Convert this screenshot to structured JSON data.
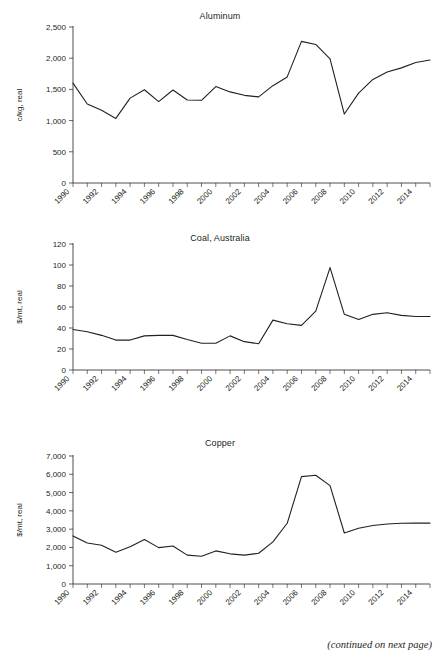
{
  "page": {
    "cut_off_heading": "",
    "footer_note": "(continued on next page)",
    "background_color": "#ffffff",
    "line_color": "#231f20"
  },
  "charts": [
    {
      "id": "aluminum",
      "title": "Aluminum",
      "ylabel": "c/kg, real",
      "xlabel": "",
      "yticks": [
        "0",
        "500",
        "1,000",
        "1,500",
        "2,000",
        "2,500"
      ],
      "xticks": [
        "1990",
        "1992",
        "1994",
        "1996",
        "1998",
        "2000",
        "2002",
        "2004",
        "2006",
        "2008",
        "2010",
        "2012",
        "2014"
      ]
    },
    {
      "id": "coal-australia",
      "title": "Coal, Australia",
      "ylabel": "$/mt, real",
      "xlabel": "",
      "yticks": [
        "0",
        "20",
        "40",
        "60",
        "80",
        "100",
        "120"
      ],
      "xticks": [
        "1990",
        "1992",
        "1994",
        "1996",
        "1998",
        "2000",
        "2002",
        "2004",
        "2006",
        "2008",
        "2010",
        "2012",
        "2014"
      ]
    },
    {
      "id": "copper",
      "title": "Copper",
      "ylabel": "$/mt, real",
      "xlabel": "",
      "yticks": [
        "0",
        "1,000",
        "2,000",
        "3,000",
        "4,000",
        "5,000",
        "6,000",
        "7,000"
      ],
      "xticks": [
        "1990",
        "1992",
        "1994",
        "1996",
        "1998",
        "2000",
        "2002",
        "2004",
        "2006",
        "2008",
        "2010",
        "2012",
        "2014"
      ]
    }
  ],
  "chart_data": [
    {
      "type": "line",
      "title": "Aluminum",
      "xlabel": "",
      "ylabel": "c/kg, real",
      "ylim": [
        0,
        2500
      ],
      "ytick_values": [
        0,
        500,
        1000,
        1500,
        2000,
        2500
      ],
      "xlim": [
        1990,
        2015
      ],
      "xtick_values": [
        1990,
        1992,
        1994,
        1996,
        1998,
        2000,
        2002,
        2004,
        2006,
        2008,
        2010,
        2012,
        2014
      ],
      "grid": false,
      "legend": false,
      "x": [
        1990,
        1991,
        1992,
        1993,
        1994,
        1995,
        1996,
        1997,
        1998,
        1999,
        2000,
        2001,
        2002,
        2003,
        2004,
        2005,
        2006,
        2007,
        2008,
        2009,
        2010,
        2011,
        2012,
        2013,
        2014,
        2015
      ],
      "series": [
        {
          "name": "Aluminum",
          "values": [
            1600,
            1265,
            1165,
            1035,
            1360,
            1495,
            1305,
            1490,
            1330,
            1325,
            1545,
            1460,
            1405,
            1380,
            1560,
            1700,
            2270,
            2220,
            1990,
            1105,
            1440,
            1660,
            1780,
            1845,
            1930,
            1970
          ]
        }
      ]
    },
    {
      "type": "line",
      "title": "Coal, Australia",
      "xlabel": "",
      "ylabel": "$/mt, real",
      "ylim": [
        0,
        120
      ],
      "ytick_values": [
        0,
        20,
        40,
        60,
        80,
        100,
        120
      ],
      "xlim": [
        1990,
        2015
      ],
      "xtick_values": [
        1990,
        1992,
        1994,
        1996,
        1998,
        2000,
        2002,
        2004,
        2006,
        2008,
        2010,
        2012,
        2014
      ],
      "grid": false,
      "legend": false,
      "x": [
        1990,
        1991,
        1992,
        1993,
        1994,
        1995,
        1996,
        1997,
        1998,
        1999,
        2000,
        2001,
        2002,
        2003,
        2004,
        2005,
        2006,
        2007,
        2008,
        2009,
        2010,
        2011,
        2012,
        2013,
        2014,
        2015
      ],
      "series": [
        {
          "name": "Coal, Australia",
          "values": [
            38.5,
            36.5,
            33,
            28.5,
            28.5,
            32.5,
            33,
            33,
            29,
            25.5,
            25.5,
            32.5,
            27,
            25,
            47.5,
            44,
            42.5,
            56,
            97.5,
            53,
            48,
            53,
            54.5,
            52,
            51,
            51
          ]
        }
      ]
    },
    {
      "type": "line",
      "title": "Copper",
      "xlabel": "",
      "ylabel": "$/mt, real",
      "ylim": [
        0,
        7000
      ],
      "ytick_values": [
        0,
        1000,
        2000,
        3000,
        4000,
        5000,
        6000,
        7000
      ],
      "xlim": [
        1990,
        2015
      ],
      "xtick_values": [
        1990,
        1992,
        1994,
        1996,
        1998,
        2000,
        2002,
        2004,
        2006,
        2008,
        2010,
        2012,
        2014
      ],
      "grid": false,
      "legend": false,
      "x": [
        1990,
        1991,
        1992,
        1993,
        1994,
        1995,
        1996,
        1997,
        1998,
        1999,
        2000,
        2001,
        2002,
        2003,
        2004,
        2005,
        2006,
        2007,
        2008,
        2009,
        2010,
        2011,
        2012,
        2013,
        2014,
        2015
      ],
      "series": [
        {
          "name": "Copper",
          "values": [
            2630,
            2240,
            2120,
            1740,
            2040,
            2430,
            1990,
            2080,
            1580,
            1520,
            1810,
            1650,
            1580,
            1680,
            2300,
            3320,
            5870,
            5950,
            5380,
            2790,
            3050,
            3200,
            3280,
            3320,
            3330,
            3330
          ]
        }
      ]
    }
  ]
}
